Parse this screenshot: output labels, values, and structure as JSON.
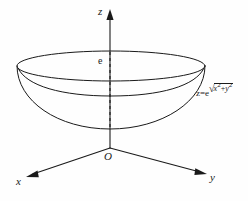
{
  "figure": {
    "background_color": "#fefefe",
    "line_color": "#1a1a1a",
    "axes": {
      "z": {
        "label": "z",
        "direction": "up",
        "has_arrow": true
      },
      "x": {
        "label": "x",
        "direction": "down-left",
        "has_arrow": true
      },
      "y": {
        "label": "y",
        "direction": "down-right",
        "has_arrow": true
      }
    },
    "origin": {
      "label": "O"
    },
    "markers": {
      "z_intercept": {
        "label": "e",
        "description": "value of z where surface meets the z-axis"
      }
    },
    "surface": {
      "equation_text": "z=e",
      "exponent_radicand_x": "x",
      "exponent_radicand_plus": "+",
      "exponent_radicand_y": "y",
      "exponent_sup": "2",
      "radical_sign": "√",
      "shape": "bowl",
      "description": "surface of revolution opening upward"
    },
    "guides": {
      "axis_segment_style": "dashed",
      "dashed_note": "hidden portion of z-axis inside the bowl"
    }
  }
}
